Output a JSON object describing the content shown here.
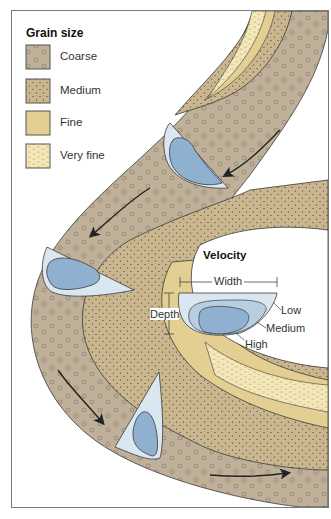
{
  "legend": {
    "title": "Grain size",
    "items": [
      {
        "label": "Coarse",
        "color": "#bfb09a",
        "pattern": "circles"
      },
      {
        "label": "Medium",
        "color": "#c9b58e",
        "pattern": "dots"
      },
      {
        "label": "Fine",
        "color": "#e3cf92",
        "pattern": "none"
      },
      {
        "label": "Very fine",
        "color": "#f4e8b8",
        "pattern": "dashes"
      }
    ]
  },
  "velocity_inset": {
    "title": "Velocity",
    "width_label": "Width",
    "depth_label": "Depth",
    "zones": [
      {
        "label": "Low",
        "color": "#dbe7f0"
      },
      {
        "label": "Medium",
        "color": "#b7cde0"
      },
      {
        "label": "High",
        "color": "#8fb0cf"
      }
    ]
  },
  "colors": {
    "coarse": "#bfb09a",
    "medium": "#c9b58e",
    "fine": "#e3cf92",
    "very_fine": "#f4e8b8",
    "water_low": "#dbe7f0",
    "water_medium": "#b7cde0",
    "water_high": "#8fb0cf",
    "outline": "#3a3a3a"
  },
  "flow_arrows": [
    {
      "position": "upper-right",
      "direction": "down-left"
    },
    {
      "position": "upper-middle",
      "direction": "down-left"
    },
    {
      "position": "lower-left",
      "direction": "down-right"
    },
    {
      "position": "bottom",
      "direction": "right"
    }
  ]
}
